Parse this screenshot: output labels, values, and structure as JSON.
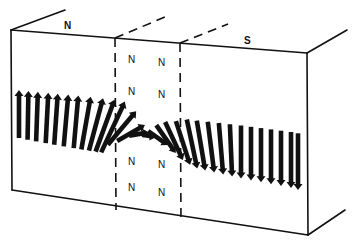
{
  "figure": {
    "face_labels": {
      "left": "N",
      "right": "S"
    },
    "wall_labels": [
      {
        "text": "N",
        "x": 128,
        "y": 55
      },
      {
        "text": "N",
        "x": 158,
        "y": 58
      },
      {
        "text": "N",
        "x": 128,
        "y": 87
      },
      {
        "text": "N",
        "x": 158,
        "y": 90
      },
      {
        "text": "N",
        "x": 128,
        "y": 157
      },
      {
        "text": "N",
        "x": 158,
        "y": 160
      },
      {
        "text": "N",
        "x": 128,
        "y": 183
      },
      {
        "text": "N",
        "x": 158,
        "y": 188
      }
    ],
    "colors": {
      "ink": "#111111",
      "background": "#ffffff"
    },
    "arrows": {
      "count_left_up": 11,
      "count_transition": 8,
      "count_right_down": 12
    }
  }
}
